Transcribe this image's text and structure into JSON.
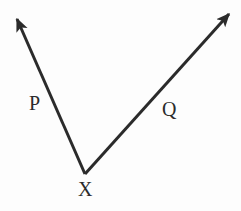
{
  "figure": {
    "kind": "geometry-diagram",
    "background_color": "#fdfdfd",
    "stroke_color": "#2b2b2b",
    "stroke_width": 3,
    "width": 241,
    "height": 211,
    "vertex": {
      "name": "X",
      "label": "X",
      "x": 85,
      "y": 174,
      "label_x": 86,
      "label_y": 189
    },
    "rays": [
      {
        "name": "P",
        "label": "P",
        "from_x": 85,
        "from_y": 174,
        "to_x": 17,
        "to_y": 19,
        "arrowhead": "end",
        "label_x": 36,
        "label_y": 103
      },
      {
        "name": "Q",
        "label": "Q",
        "from_x": 85,
        "from_y": 174,
        "to_x": 229,
        "to_y": 14,
        "arrowhead": "end",
        "label_x": 171,
        "label_y": 110
      }
    ]
  }
}
